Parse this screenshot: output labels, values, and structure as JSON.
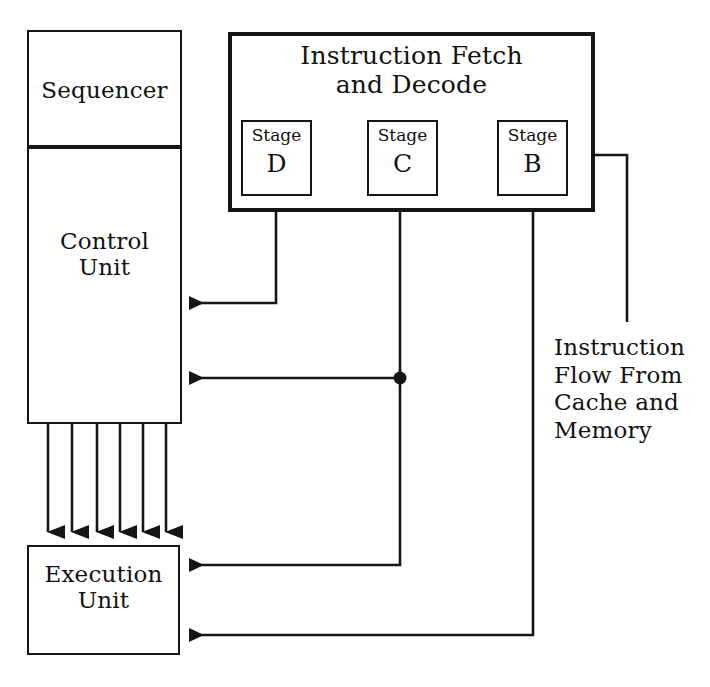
{
  "diagram": {
    "title_hidden": "CPU instruction pipeline block diagram",
    "blocks": {
      "sequencer": {
        "label": "Sequencer"
      },
      "control_unit": {
        "label": "Control\nUnit"
      },
      "execution_unit": {
        "label": "Execution\nUnit"
      },
      "fetch_decode": {
        "label": "Instruction Fetch\nand Decode"
      }
    },
    "stages": [
      {
        "id": "stage-d",
        "top": "Stage",
        "letter": "D"
      },
      {
        "id": "stage-c",
        "top": "Stage",
        "letter": "C"
      },
      {
        "id": "stage-b",
        "top": "Stage",
        "letter": "B"
      }
    ],
    "annotations": {
      "instruction_flow": "Instruction\nFlow From\nCache and\nMemory"
    },
    "colors": {
      "line": "#151515",
      "background": "#ffffff",
      "text": "#111111"
    },
    "connections": [
      {
        "name": "stage-b-to-stage-c",
        "from": "Stage B",
        "to": "Stage C",
        "kind": "arrow"
      },
      {
        "name": "stage-c-to-stage-d",
        "from": "Stage C",
        "to": "Stage D",
        "kind": "arrow"
      },
      {
        "name": "external-to-stage-b",
        "from": "Instruction Flow From Cache and Memory",
        "to": "Stage B",
        "kind": "arrow"
      },
      {
        "name": "stage-d-to-control-unit",
        "from": "Stage D",
        "to": "Control Unit",
        "kind": "arrow"
      },
      {
        "name": "stage-c-to-control-unit",
        "from": "Stage C",
        "to": "Control Unit",
        "kind": "arrow"
      },
      {
        "name": "stage-c-to-execution-unit",
        "from": "Stage C",
        "to": "Execution Unit",
        "kind": "arrow"
      },
      {
        "name": "stage-b-to-execution-unit",
        "from": "Stage B",
        "to": "Execution Unit",
        "kind": "arrow"
      },
      {
        "name": "control-unit-to-execution-unit",
        "from": "Control Unit",
        "to": "Execution Unit",
        "kind": "arrow-bus",
        "count": 6
      }
    ]
  }
}
